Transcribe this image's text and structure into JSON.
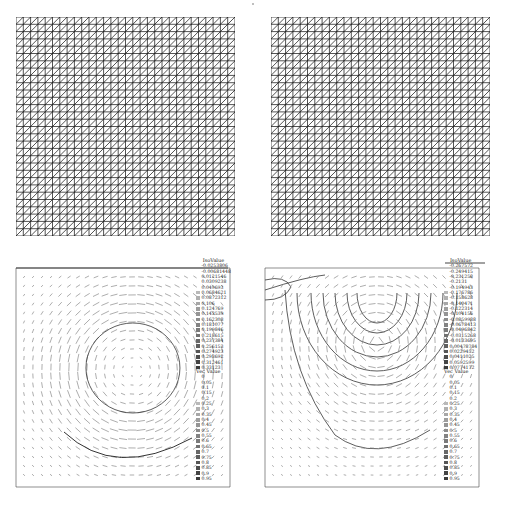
{
  "figure": {
    "meshes": [
      {
        "id": "mesh-left",
        "grid_cells": 30,
        "diagonal": "lower-left to upper-right"
      },
      {
        "id": "mesh-right",
        "grid_cells": 30,
        "diagonal": "lower-left to upper-right"
      }
    ],
    "plots": [
      {
        "id": "plot-left",
        "iso_legend": {
          "title": "IsoValue",
          "values": [
            "-0.0253806",
            "-0.00681448",
            "0.0121546",
            "0.0309238",
            "0.049693",
            "0.0684621",
            "0.0872312",
            "0.106",
            "0.124769",
            "0.143539",
            "0.162308",
            "0.181077",
            "0.199846",
            "0.218615",
            "0.237384",
            "0.256153",
            "0.274923",
            "0.293692",
            "0.312461",
            "0.33123"
          ]
        },
        "vec_legend": {
          "title": "Vec Value",
          "values": [
            "0",
            "0.05",
            "0.1",
            "0.15",
            "0.2",
            "0.25",
            "0.3",
            "0.35",
            "0.4",
            "0.45",
            "0.5",
            "0.55",
            "0.6",
            "0.65",
            "0.7",
            "0.75",
            "0.8",
            "0.85",
            "0.9",
            "0.95"
          ]
        }
      },
      {
        "id": "plot-right",
        "iso_legend": {
          "title": "IsoValue",
          "values": [
            "-0.267572",
            "-0.249415",
            "-0.231258",
            "-0.2131",
            "-0.194943",
            "-0.176786",
            "-0.158628",
            "-0.140471",
            "-0.122314",
            "-0.104156",
            "-0.0859988",
            "-0.0678413",
            "-0.0496842",
            "-0.0315268",
            "-0.0133695",
            "0.00478784",
            "0.0229452",
            "0.0411025",
            "0.0592599",
            "0.0774172"
          ]
        },
        "vec_legend": {
          "title": "Vec Value",
          "values": [
            "0",
            "0.05",
            "0.1",
            "0.15",
            "0.2",
            "0.25",
            "0.3",
            "0.35",
            "0.4",
            "0.45",
            "0.5",
            "0.55",
            "0.6",
            "0.65",
            "0.7",
            "0.75",
            "0.8",
            "0.85",
            "0.9",
            "0.95"
          ]
        }
      }
    ],
    "colors": {
      "mesh_line": "#1a1a1a",
      "contour": "#333333",
      "vector": "#8a8a8a",
      "frame": "#444444"
    }
  }
}
